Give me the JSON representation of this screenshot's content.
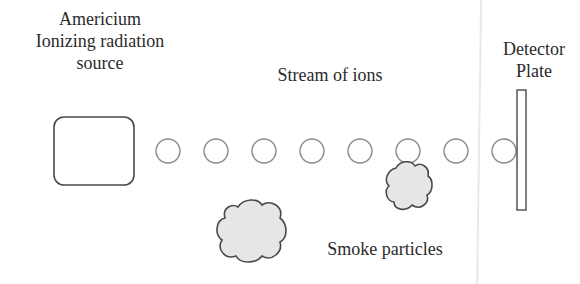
{
  "diagram": {
    "labels": {
      "source": [
        "Americium",
        "Ionizing radiation",
        "source"
      ],
      "stream": "Stream of ions",
      "detector": [
        "Detector",
        "Plate"
      ],
      "smoke": "Smoke particles"
    },
    "ion_count": 8,
    "smoke_particle_count": 2,
    "colors": {
      "outline": "#555555",
      "ion_outline": "#8a8a8a",
      "smoke_fill": "#e6e6e6",
      "text": "#2b2b2b"
    }
  }
}
